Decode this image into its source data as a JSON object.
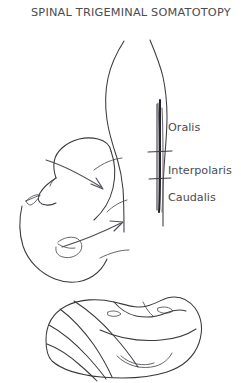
{
  "figure": {
    "title": "SPINAL TRIGEMINAL SOMATOTOPY",
    "background_color": "#ffffff",
    "ink_color": "#3a3a3e",
    "tract_color": "#232327",
    "label_color": "#4b4b52",
    "width": 241,
    "height": 383
  },
  "brainstem": {
    "name": "brainstem-outline",
    "tract_name": "spinal-trigeminal-tract",
    "subnuclei": [
      {
        "id": "oralis",
        "label": "Oralis",
        "x": 168,
        "y": 131
      },
      {
        "id": "interpolaris",
        "label": "Interpolaris",
        "x": 168,
        "y": 174
      },
      {
        "id": "caudalis",
        "label": "Caudalis",
        "x": 168,
        "y": 201
      }
    ],
    "division_ticks": [
      {
        "id": "oralis-interpolaris-border",
        "y": 152
      },
      {
        "id": "interpolaris-caudalis-border",
        "y": 179
      }
    ]
  },
  "face_profile": {
    "name": "face-profile-lateral",
    "features": [
      "forehead",
      "nose",
      "eye",
      "lips",
      "chin",
      "jaw"
    ]
  },
  "dermatome_head": {
    "name": "onion-skin-dermatome-head",
    "band_count": 4,
    "features": [
      "eye",
      "nose",
      "mouth",
      "chin",
      "concentric-bands"
    ]
  },
  "arrows": [
    {
      "id": "arrow-upper-face-to-tract",
      "from": "face-upper",
      "to": "tract-rostral"
    },
    {
      "id": "arrow-lower-face-to-tract",
      "from": "face-lower",
      "to": "tract-caudal"
    }
  ]
}
